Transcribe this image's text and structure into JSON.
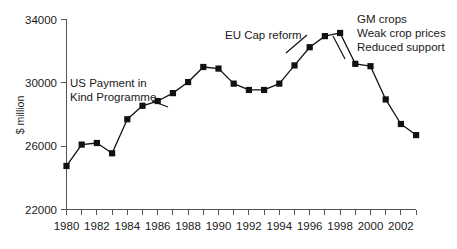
{
  "chart_data": {
    "type": "line",
    "title": "",
    "subtitle": "",
    "xlabel": "",
    "ylabel": "$ million",
    "xlim": [
      1979.5,
      2003.5
    ],
    "ylim": [
      22000,
      34000
    ],
    "grid": false,
    "legend": "none",
    "y_ticks": [
      22000,
      26000,
      30000,
      34000
    ],
    "y_tick_labels": [
      "22000",
      "26000",
      "30000",
      "34000"
    ],
    "x_ticks": [
      1980,
      1981,
      1982,
      1983,
      1984,
      1985,
      1986,
      1987,
      1988,
      1989,
      1990,
      1991,
      1992,
      1993,
      1994,
      1995,
      1996,
      1997,
      1998,
      1999,
      2000,
      2001,
      2002,
      2003
    ],
    "x_tick_labels": [
      "1980",
      "",
      "1982",
      "",
      "1984",
      "",
      "1986",
      "",
      "1988",
      "",
      "1990",
      "",
      "1992",
      "",
      "1994",
      "",
      "1996",
      "",
      "1998",
      "",
      "2000",
      "",
      "2002",
      ""
    ],
    "x": [
      1980,
      1981,
      1982,
      1983,
      1984,
      1985,
      1986,
      1987,
      1988,
      1989,
      1990,
      1991,
      1992,
      1993,
      1994,
      1995,
      1996,
      1997,
      1998,
      1999,
      2000,
      2001,
      2002,
      2003
    ],
    "values": [
      24750,
      26100,
      26200,
      25550,
      27700,
      28550,
      28850,
      29350,
      30050,
      31000,
      30900,
      29950,
      29550,
      29550,
      29950,
      31100,
      32250,
      32950,
      33150,
      31200,
      31050,
      28950,
      27400,
      26700
    ],
    "series": [
      {
        "name": "US farm support",
        "color": "#111111",
        "marker": "square",
        "values": [
          24750,
          26100,
          26200,
          25550,
          27700,
          28550,
          28850,
          29350,
          30050,
          31000,
          30900,
          29950,
          29550,
          29550,
          29950,
          31100,
          32250,
          32950,
          33150,
          31200,
          31050,
          28950,
          27400,
          26700
        ]
      }
    ],
    "annotations": [
      {
        "id": "us-payment-in-kind",
        "lines": [
          "US Payment in",
          "Kind Programme"
        ],
        "target_x": 1985,
        "target_y": 28550
      },
      {
        "id": "eu-cap-reform",
        "lines": [
          "EU Cap reform"
        ],
        "target_x": 1993,
        "target_y": 29550
      },
      {
        "id": "gm-crops-block",
        "lines": [
          "GM crops",
          "Weak crop prices",
          "Reduced support"
        ],
        "target_x": 1998,
        "target_y": 33150
      }
    ]
  },
  "axis": {
    "y_label": "$ million",
    "y_tick_0": "22000",
    "y_tick_1": "26000",
    "y_tick_2": "30000",
    "y_tick_3": "34000"
  },
  "x_labels": {
    "l1980": "1980",
    "l1982": "1982",
    "l1984": "1984",
    "l1986": "1986",
    "l1988": "1988",
    "l1990": "1990",
    "l1992": "1992",
    "l1994": "1994",
    "l1996": "1996",
    "l1998": "1998",
    "l2000": "2000",
    "l2002": "2002"
  },
  "annotations": {
    "us_line1": "US Payment in",
    "us_line2": "Kind Programme",
    "eu_line1": "EU Cap reform",
    "gm_line1": "GM crops",
    "gm_line2": "Weak crop prices",
    "gm_line3": "Reduced support"
  },
  "colors": {
    "series": "#111111",
    "axis": "#555555",
    "text": "#1a1a1a",
    "background": "#ffffff"
  }
}
